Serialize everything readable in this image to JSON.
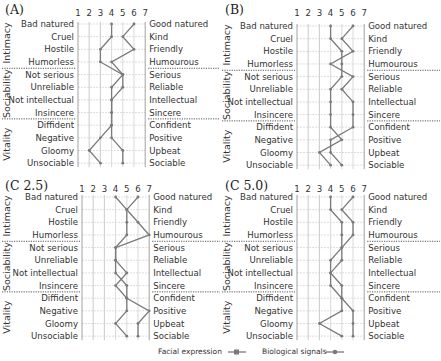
{
  "chart_data": [
    {
      "type": "line",
      "title": "(A)",
      "scale": [
        1,
        2,
        3,
        4,
        5,
        6,
        7
      ],
      "left_labels": [
        "Bad natured",
        "Cruel",
        "Hostile",
        "Humorless",
        "Not serious",
        "Unreliable",
        "Not intellectual",
        "Insincere",
        "Diffident",
        "Negative",
        "Gloomy",
        "Unsociable"
      ],
      "right_labels": [
        "Good natured",
        "Kind",
        "Friendly",
        "Humourous",
        "Serious",
        "Reliable",
        "Intellectual",
        "Sincere",
        "Confident",
        "Positive",
        "Upbeat",
        "Sociable"
      ],
      "groups": [
        {
          "name": "Intimacy",
          "rows": [
            0,
            3
          ]
        },
        {
          "name": "Sociability",
          "rows": [
            4,
            7
          ]
        },
        {
          "name": "Vitality",
          "rows": [
            8,
            11
          ]
        }
      ],
      "series": [
        {
          "name": "Facial expression",
          "values": [
            4,
            4,
            3,
            3,
            5,
            4,
            4,
            4,
            4,
            3,
            2,
            3
          ]
        },
        {
          "name": "Biological signals",
          "values": [
            6,
            5,
            6,
            4,
            5,
            5,
            4,
            4,
            4,
            4,
            5,
            5
          ]
        }
      ]
    },
    {
      "type": "line",
      "title": "(B)",
      "scale": [
        1,
        2,
        3,
        4,
        5,
        6,
        7
      ],
      "left_labels": [
        "Bad natured",
        "Cruel",
        "Hostile",
        "Humorless",
        "Not serious",
        "Unreliable",
        "Not intellectual",
        "Insincere",
        "Diffident",
        "Negative",
        "Gloomy",
        "Unsociable"
      ],
      "right_labels": [
        "Good natured",
        "Kind",
        "Friendly",
        "Humourous",
        "Serious",
        "Reliable",
        "Intellectual",
        "Sincere",
        "Confident",
        "Positive",
        "Upbeat",
        "Sociable"
      ],
      "groups": [
        {
          "name": "Intimacy",
          "rows": [
            0,
            3
          ]
        },
        {
          "name": "Sociability",
          "rows": [
            4,
            7
          ]
        },
        {
          "name": "Vitality",
          "rows": [
            8,
            11
          ]
        }
      ],
      "series": [
        {
          "name": "Facial expression",
          "values": [
            4,
            4,
            5,
            5,
            5,
            4,
            4,
            4,
            4,
            5,
            3,
            4
          ]
        },
        {
          "name": "Biological signals",
          "values": [
            6,
            5,
            6,
            4,
            6,
            5,
            6,
            6,
            6,
            4,
            4,
            5
          ]
        }
      ]
    },
    {
      "type": "line",
      "title": "(C 2.5)",
      "scale": [
        1,
        2,
        3,
        4,
        5,
        6,
        7
      ],
      "left_labels": [
        "Bad natured",
        "Cruel",
        "Hostile",
        "Humorless",
        "Not serious",
        "Unreliable",
        "Not intellectual",
        "Insincere",
        "Diffident",
        "Negative",
        "Gloomy",
        "Unsociable"
      ],
      "right_labels": [
        "Good natured",
        "Kind",
        "Friendly",
        "Humourous",
        "Serious",
        "Reliable",
        "Intellectual",
        "Sincere",
        "Confident",
        "Positive",
        "Upbeat",
        "Sociable"
      ],
      "groups": [
        {
          "name": "Intimacy",
          "rows": [
            0,
            3
          ]
        },
        {
          "name": "Sociability",
          "rows": [
            4,
            7
          ]
        },
        {
          "name": "Vitality",
          "rows": [
            8,
            11
          ]
        }
      ],
      "series": [
        {
          "name": "Facial expression",
          "values": [
            4,
            5,
            5,
            5,
            4,
            4,
            4,
            5,
            5,
            5,
            4,
            5
          ]
        },
        {
          "name": "Biological signals",
          "values": [
            6,
            5,
            6,
            7,
            4,
            4,
            5,
            4,
            5,
            7,
            6,
            6
          ]
        }
      ]
    },
    {
      "type": "line",
      "title": "(C 5.0)",
      "scale": [
        1,
        2,
        3,
        4,
        5,
        6,
        7
      ],
      "left_labels": [
        "Bad natured",
        "Cruel",
        "Hostile",
        "Humorless",
        "Not serious",
        "Unreliable",
        "Not intellectual",
        "Insincere",
        "Diffident",
        "Negative",
        "Gloomy",
        "Unsociable"
      ],
      "right_labels": [
        "Good natured",
        "Kind",
        "Friendly",
        "Humourous",
        "Serious",
        "Reliable",
        "Intellectual",
        "Sincere",
        "Confident",
        "Positive",
        "Upbeat",
        "Sociable"
      ],
      "groups": [
        {
          "name": "Intimacy",
          "rows": [
            0,
            3
          ]
        },
        {
          "name": "Sociability",
          "rows": [
            4,
            7
          ]
        },
        {
          "name": "Vitality",
          "rows": [
            8,
            11
          ]
        }
      ],
      "series": [
        {
          "name": "Facial expression",
          "values": [
            4,
            4,
            5,
            5,
            5,
            5,
            4,
            5,
            5,
            5,
            3,
            5
          ]
        },
        {
          "name": "Biological signals",
          "values": [
            6,
            5,
            6,
            6,
            5,
            4,
            4,
            4,
            5,
            6,
            6,
            6
          ]
        }
      ]
    }
  ],
  "legend": {
    "facial_label": "Facial expression",
    "bio_label": "Biological signals"
  },
  "colors": {
    "line": "#7a7a7a",
    "grid": "#cfcfcf",
    "axis": "#8a8a8a"
  }
}
